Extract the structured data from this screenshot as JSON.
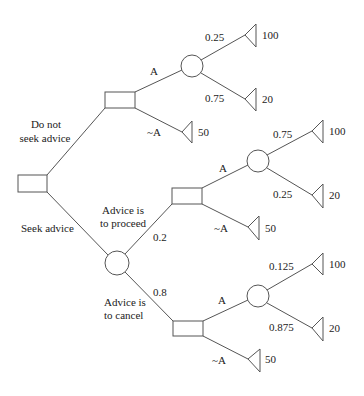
{
  "diagram": {
    "type": "decision-tree",
    "colors": {
      "line": "#555555",
      "text": "#222222",
      "background": "#ffffff"
    },
    "labels": {
      "do_not_seek_1": "Do not",
      "do_not_seek_2": "seek advice",
      "seek_advice": "Seek advice",
      "proceed_1": "Advice is",
      "proceed_2": "to proceed",
      "cancel_1": "Advice is",
      "cancel_2": "to cancel",
      "p_proceed": "0.2",
      "p_cancel": "0.8",
      "top_A": "A",
      "top_notA": "~A",
      "mid_A": "A",
      "mid_notA": "~A",
      "bot_A": "A",
      "bot_notA": "~A",
      "top_p_hi": "0.25",
      "top_p_lo": "0.75",
      "mid_p_hi": "0.75",
      "mid_p_lo": "0.25",
      "bot_p_hi": "0.125",
      "bot_p_lo": "0.875"
    },
    "payoffs": {
      "top_hi": "100",
      "top_lo": "20",
      "top_notA": "50",
      "mid_hi": "100",
      "mid_lo": "20",
      "mid_notA": "50",
      "bot_hi": "100",
      "bot_lo": "20",
      "bot_notA": "50"
    }
  }
}
